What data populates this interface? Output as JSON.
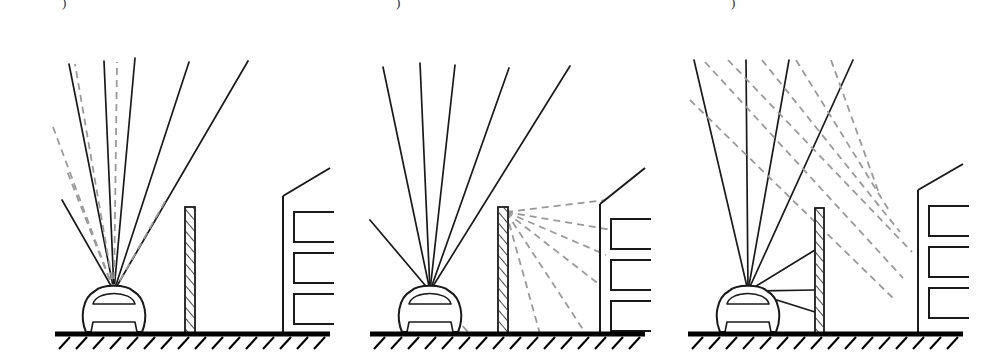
{
  "figure": {
    "width": 1002,
    "height": 364,
    "background_color": "#ffffff",
    "solid_ray_color": "#1a1a1a",
    "dashed_ray_color": "#9a9a9a",
    "outline_color": "#1a1a1a",
    "ground_color": "#000000"
  },
  "panels": [
    {
      "id": "panel-a",
      "label_remnant": ")",
      "label_x": 62,
      "label_y": -4,
      "description": "Direct sound rays radiating from vehicle, unobstructed over barrier",
      "origin_x": 114,
      "origin_y": 291,
      "ground": {
        "x1": 55,
        "x2": 330,
        "y": 334
      },
      "barrier": {
        "x": 185,
        "y_top": 207,
        "width": 10,
        "y_bottom": 334
      },
      "building": {
        "x_wall": 283,
        "y_eave": 196,
        "x_ridge": 330,
        "y_ridge": 168,
        "y_base": 334
      },
      "windows": [
        {
          "x": 294,
          "y": 212,
          "w": 40,
          "h": 30
        },
        {
          "x": 294,
          "y": 253,
          "w": 40,
          "h": 30
        },
        {
          "x": 294,
          "y": 294,
          "w": 40,
          "h": 30
        }
      ],
      "solid_rays": [
        {
          "x": 62,
          "y": 200
        },
        {
          "x": 69,
          "y": 64
        },
        {
          "x": 104,
          "y": 61
        },
        {
          "x": 135,
          "y": 58
        },
        {
          "x": 189,
          "y": 62
        },
        {
          "x": 248,
          "y": 61
        }
      ],
      "dashed_rays": [
        {
          "x": 53,
          "y": 127
        },
        {
          "x": 67,
          "y": 171
        },
        {
          "x": 75,
          "y": 64
        },
        {
          "x": 117,
          "y": 62
        },
        {
          "x": 167,
          "y": 198
        }
      ]
    },
    {
      "id": "panel-b",
      "label_remnant": ")",
      "label_x": 396,
      "label_y": -4,
      "description": "Sound diffracting over the top edge of the barrier into the shadow zone",
      "origin_x": 430,
      "origin_y": 291,
      "ground": {
        "x1": 370,
        "x2": 645,
        "y": 334
      },
      "barrier": {
        "x": 498,
        "y_top": 207,
        "width": 10,
        "y_bottom": 334
      },
      "building": {
        "x_wall": 600,
        "y_eave": 204,
        "x_ridge": 645,
        "y_ridge": 168,
        "y_base": 334
      },
      "windows": [
        {
          "x": 611,
          "y": 219,
          "w": 40,
          "h": 30
        },
        {
          "x": 611,
          "y": 260,
          "w": 40,
          "h": 30
        },
        {
          "x": 611,
          "y": 301,
          "w": 40,
          "h": 30
        }
      ],
      "solid_rays": [
        {
          "x": 370,
          "y": 220
        },
        {
          "x": 383,
          "y": 67
        },
        {
          "x": 420,
          "y": 63
        },
        {
          "x": 455,
          "y": 65
        },
        {
          "x": 509,
          "y": 68
        },
        {
          "x": 570,
          "y": 66
        }
      ],
      "diffraction_apex": {
        "x": 506,
        "y": 212
      },
      "diffracted_rays": [
        {
          "x": 606,
          "y": 200
        },
        {
          "x": 612,
          "y": 230
        },
        {
          "x": 606,
          "y": 255
        },
        {
          "x": 600,
          "y": 285
        },
        {
          "x": 586,
          "y": 334
        },
        {
          "x": 540,
          "y": 334
        },
        {
          "x": 508,
          "y": 334
        }
      ],
      "spill_rays": [
        {
          "x": 470,
          "y": 334
        },
        {
          "x": 455,
          "y": 300
        }
      ]
    },
    {
      "id": "panel-c",
      "label_remnant": ")",
      "label_x": 731,
      "label_y": -4,
      "description": "Sound reflecting off the barrier face and travelling towards the building facade",
      "origin_x": 748,
      "origin_y": 291,
      "ground": {
        "x1": 688,
        "x2": 963,
        "y": 334
      },
      "barrier": {
        "x": 815,
        "y_top": 208,
        "width": 9,
        "y_bottom": 334
      },
      "building": {
        "x_wall": 918,
        "y_eave": 190,
        "x_ridge": 963,
        "y_ridge": 164,
        "y_base": 334
      },
      "windows": [
        {
          "x": 929,
          "y": 206,
          "w": 40,
          "h": 30
        },
        {
          "x": 929,
          "y": 247,
          "w": 40,
          "h": 30
        },
        {
          "x": 929,
          "y": 288,
          "w": 40,
          "h": 30
        }
      ],
      "solid_rays": [
        {
          "x": 694,
          "y": 60
        },
        {
          "x": 746,
          "y": 60
        },
        {
          "x": 789,
          "y": 60
        },
        {
          "x": 853,
          "y": 60
        },
        {
          "x": 815,
          "y": 250
        },
        {
          "x": 815,
          "y": 290
        },
        {
          "x": 815,
          "y": 312
        }
      ],
      "reflected_rays": [
        {
          "x1": 705,
          "y1": 62,
          "x2": 903,
          "y2": 278
        },
        {
          "x1": 728,
          "y1": 60,
          "x2": 912,
          "y2": 252
        },
        {
          "x1": 762,
          "y1": 60,
          "x2": 900,
          "y2": 232
        },
        {
          "x1": 796,
          "y1": 60,
          "x2": 890,
          "y2": 212
        },
        {
          "x1": 831,
          "y1": 60,
          "x2": 880,
          "y2": 196
        },
        {
          "x1": 690,
          "y1": 100,
          "x2": 895,
          "y2": 300
        }
      ]
    }
  ],
  "legend": {
    "solid_label": "direct / incident sound ray",
    "dashed_label": "diffracted / reflected sound ray"
  }
}
